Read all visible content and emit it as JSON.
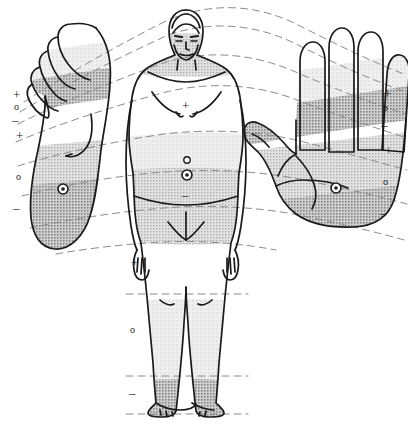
{
  "figure": {
    "colors": {
      "outline": "#1a1a1a",
      "dashed_band": "#8a8a8a",
      "shade_light": "#e3e3e3",
      "shade_mid": "#c9c9c9",
      "shade_dark": "#a8a8a8",
      "background": "#ffffff",
      "marker": "#1a1a1a"
    }
  },
  "parts": {
    "foot": {
      "label": "foot-sole-plantar",
      "side": "left"
    },
    "body": {
      "label": "human-body-frontal",
      "side": "center"
    },
    "hand": {
      "label": "hand-palm-palmar",
      "side": "right"
    }
  },
  "markers": {
    "foot_left_column": [
      {
        "id": "foot-marker-1",
        "glyph": "+",
        "x": 13,
        "y": 93
      },
      {
        "id": "foot-marker-2",
        "glyph": "o",
        "x": 13,
        "y": 106
      },
      {
        "id": "foot-marker-3",
        "glyph": "–",
        "x": 12,
        "y": 119
      },
      {
        "id": "foot-marker-4",
        "glyph": "+",
        "x": 16,
        "y": 134
      },
      {
        "id": "foot-marker-5",
        "glyph": "o",
        "x": 15,
        "y": 176
      },
      {
        "id": "foot-marker-6",
        "glyph": "–",
        "x": 13,
        "y": 207
      }
    ],
    "hand_right_column": [
      {
        "id": "hand-marker-1",
        "glyph": "+",
        "x": 384,
        "y": 92
      },
      {
        "id": "hand-marker-2",
        "glyph": "o",
        "x": 383,
        "y": 107
      },
      {
        "id": "hand-marker-3",
        "glyph": "–",
        "x": 382,
        "y": 124
      },
      {
        "id": "hand-marker-4",
        "glyph": "+",
        "x": 386,
        "y": 149
      },
      {
        "id": "hand-marker-5",
        "glyph": "o",
        "x": 383,
        "y": 181
      },
      {
        "id": "hand-marker-6",
        "glyph": "–",
        "x": 381,
        "y": 212
      }
    ],
    "body_column": [
      {
        "id": "body-marker-chest",
        "glyph": "+",
        "x": 183,
        "y": 104
      },
      {
        "id": "body-marker-upper-abdomen",
        "glyph": "o",
        "x": 184,
        "y": 157
      },
      {
        "id": "body-marker-navel",
        "glyph": "◎",
        "x": 182,
        "y": 170
      },
      {
        "id": "body-marker-lower-abdomen",
        "glyph": "–",
        "x": 183,
        "y": 193
      },
      {
        "id": "body-marker-thigh",
        "glyph": "+",
        "x": 133,
        "y": 261
      },
      {
        "id": "body-marker-lower-leg",
        "glyph": "o",
        "x": 131,
        "y": 329
      },
      {
        "id": "body-marker-ankle",
        "glyph": "–",
        "x": 130,
        "y": 391
      }
    ],
    "target_points": [
      {
        "id": "foot-heel-target",
        "glyph": "◎",
        "x": 63,
        "y": 189
      },
      {
        "id": "hand-palm-target",
        "glyph": "◎",
        "x": 336,
        "y": 188
      },
      {
        "id": "body-navel-target",
        "glyph": "◎",
        "x": 187,
        "y": 175
      }
    ]
  },
  "caption": {
    "text": ""
  }
}
